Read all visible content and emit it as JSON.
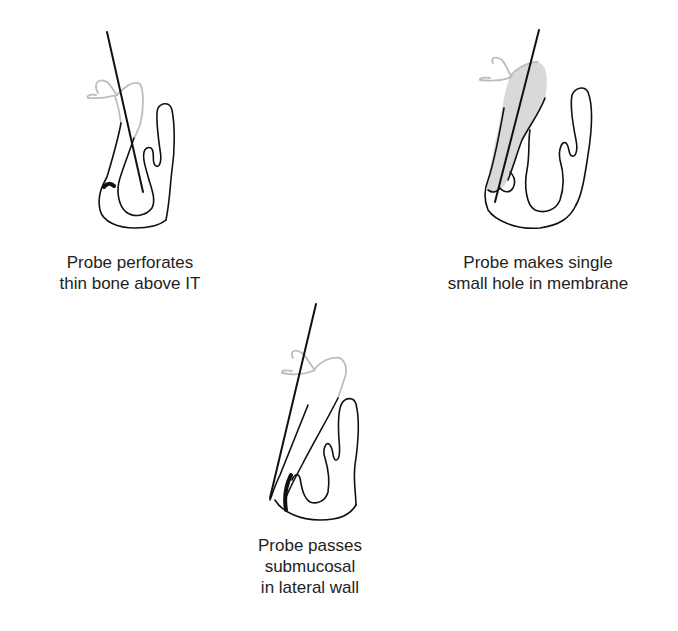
{
  "figure": {
    "panels": [
      {
        "id": "perforation",
        "caption_lines": [
          "Probe perforates",
          "thin bone above IT"
        ]
      },
      {
        "id": "single-hole",
        "caption_lines": [
          "Probe makes single",
          "small hole in membrane"
        ]
      },
      {
        "id": "submucosal",
        "caption_lines": [
          "Probe passes",
          "submucosal",
          "in lateral wall"
        ]
      }
    ],
    "colors": {
      "outline": "#111111",
      "uncinate_gray": "#bdbdbd",
      "membrane_fill": "#d9d9d9",
      "background": "#ffffff"
    }
  }
}
